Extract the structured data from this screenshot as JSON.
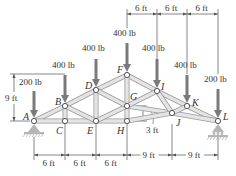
{
  "diagram": {
    "colors": {
      "member_fill": "#e4e4e4",
      "member_stroke": "#9a9a9a",
      "arrow": "#7a7a7a",
      "dim_line": "#555555",
      "text": "#333333",
      "joint_fill": "#ffffff",
      "joint_stroke": "#555555",
      "support": "#b5b5b5"
    },
    "nodes": [
      {
        "id": "A",
        "x": 34,
        "y": 121,
        "label_dx": -11,
        "label_dy": -1
      },
      {
        "id": "B",
        "x": 65,
        "y": 106,
        "label_dx": -10,
        "label_dy": -1
      },
      {
        "id": "C",
        "x": 65,
        "y": 121,
        "label_dx": -9,
        "label_dy": 13
      },
      {
        "id": "D",
        "x": 96,
        "y": 90,
        "label_dx": -11,
        "label_dy": -1
      },
      {
        "id": "E",
        "x": 96,
        "y": 121,
        "label_dx": -9,
        "label_dy": 13
      },
      {
        "id": "F",
        "x": 127,
        "y": 75,
        "label_dx": -10,
        "label_dy": -2
      },
      {
        "id": "G",
        "x": 127,
        "y": 106,
        "label_dx": 3,
        "label_dy": -6
      },
      {
        "id": "H",
        "x": 127,
        "y": 121,
        "label_dx": -10,
        "label_dy": 13
      },
      {
        "id": "I",
        "x": 157,
        "y": 91,
        "label_dx": 4,
        "label_dy": -1
      },
      {
        "id": "J",
        "x": 172,
        "y": 113,
        "label_dx": 4,
        "label_dy": 13
      },
      {
        "id": "K",
        "x": 187,
        "y": 106,
        "label_dx": 5,
        "label_dy": 0
      },
      {
        "id": "L",
        "x": 218,
        "y": 121,
        "label_dx": 5,
        "label_dy": -1
      }
    ],
    "members": [
      [
        "A",
        "B"
      ],
      [
        "B",
        "D"
      ],
      [
        "D",
        "F"
      ],
      [
        "F",
        "I"
      ],
      [
        "I",
        "K"
      ],
      [
        "K",
        "L"
      ],
      [
        "A",
        "C"
      ],
      [
        "C",
        "E"
      ],
      [
        "E",
        "H"
      ],
      [
        "B",
        "C"
      ],
      [
        "D",
        "E"
      ],
      [
        "F",
        "G"
      ],
      [
        "G",
        "H"
      ],
      [
        "B",
        "E"
      ],
      [
        "E",
        "G"
      ],
      [
        "D",
        "G"
      ],
      [
        "G",
        "J"
      ],
      [
        "J",
        "L"
      ],
      [
        "G",
        "I"
      ],
      [
        "I",
        "J"
      ],
      [
        "J",
        "K"
      ],
      [
        "H",
        "J"
      ]
    ],
    "loads": [
      {
        "node": "A",
        "label": "200 lb",
        "top": 91,
        "label_x": 19,
        "label_y": 85
      },
      {
        "node": "B",
        "label": "400 lb",
        "top": 75,
        "label_x": 52,
        "label_y": 68
      },
      {
        "node": "D",
        "label": "400 lb",
        "top": 59,
        "label_x": 82,
        "label_y": 51
      },
      {
        "node": "F",
        "label": "400 lb",
        "top": 43,
        "label_x": 113,
        "label_y": 36
      },
      {
        "node": "I",
        "label": "400 lb",
        "top": 59,
        "label_x": 142,
        "label_y": 51
      },
      {
        "node": "K",
        "label": "400 lb",
        "top": 75,
        "label_x": 174,
        "label_y": 68
      },
      {
        "node": "L",
        "label": "200 lb",
        "top": 89,
        "label_x": 204,
        "label_y": 82
      }
    ],
    "dimensions": {
      "top": {
        "y": 14,
        "ticks_x": [
          127,
          157,
          187,
          218
        ],
        "labels": [
          "6 ft",
          "6 ft",
          "6 ft"
        ]
      },
      "bottom": {
        "y": 155,
        "ticks_x": [
          34,
          65,
          96,
          127,
          172,
          218
        ],
        "labels": [
          "6 ft",
          "6 ft",
          "6 ft",
          "9 ft",
          "9 ft"
        ]
      },
      "height": {
        "x": 14,
        "y_top": 74,
        "y_bottom": 121,
        "label": "9 ft"
      },
      "offset": {
        "x": 143,
        "y_top": 106,
        "y_bottom": 121,
        "label": "3 ft"
      }
    },
    "supports": [
      {
        "node": "A",
        "type": "pin"
      },
      {
        "node": "L",
        "type": "roller"
      }
    ]
  }
}
